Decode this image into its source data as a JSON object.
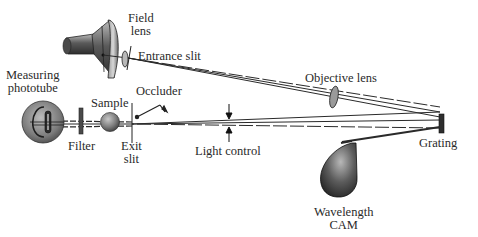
{
  "diagram": {
    "type": "spectrophotometer optical path",
    "colors": {
      "ink": "#2a2a2a",
      "component_dark": "#3a3a3a",
      "component_mid": "#8a8a8a",
      "component_light": "#d6d6d6",
      "background": "#ffffff"
    },
    "labels": {
      "field_lens": [
        "Field",
        "lens"
      ],
      "entrance_slit": "Entrance slit",
      "measuring_phototube": [
        "Measuring",
        "phototube"
      ],
      "occluder": "Occluder",
      "sample": "Sample",
      "filter": "Filter",
      "exit_slit": [
        "Exit",
        "slit"
      ],
      "light_control": "Light control",
      "objective_lens": "Objective lens",
      "grating": "Grating",
      "wavelength_cam": [
        "Wavelength",
        "CAM"
      ]
    },
    "components": [
      {
        "id": "lamp",
        "icon": "lamp-housing-icon"
      },
      {
        "id": "field-lens",
        "icon": "lens-icon"
      },
      {
        "id": "entrance-slit",
        "icon": "slit-icon"
      },
      {
        "id": "objective-lens",
        "icon": "lens-icon"
      },
      {
        "id": "grating",
        "icon": "grating-icon"
      },
      {
        "id": "wavelength-cam",
        "icon": "cam-icon"
      },
      {
        "id": "light-control",
        "icon": "arrow-pair-icon"
      },
      {
        "id": "occluder",
        "icon": "occluder-icon"
      },
      {
        "id": "exit-slit",
        "icon": "slit-icon"
      },
      {
        "id": "sample",
        "icon": "sample-sphere-icon"
      },
      {
        "id": "filter",
        "icon": "filter-icon"
      },
      {
        "id": "measuring-phototube",
        "icon": "phototube-icon"
      }
    ]
  }
}
